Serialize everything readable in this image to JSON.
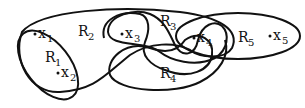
{
  "diagram": {
    "type": "hypergraph",
    "vertices": [
      {
        "id": "x1",
        "name": "x",
        "sub": "1"
      },
      {
        "id": "x2",
        "name": "x",
        "sub": "2"
      },
      {
        "id": "x3",
        "name": "x",
        "sub": "3"
      },
      {
        "id": "x4",
        "name": "x",
        "sub": "4"
      },
      {
        "id": "x5",
        "name": "x",
        "sub": "5"
      }
    ],
    "hyperedges": [
      {
        "id": "R1",
        "name": "R",
        "sub": "1",
        "members": [
          "x1",
          "x2"
        ]
      },
      {
        "id": "R2",
        "name": "R",
        "sub": "2",
        "members": [
          "x1",
          "x2",
          "x3",
          "x4"
        ]
      },
      {
        "id": "R3",
        "name": "R",
        "sub": "3",
        "members": [
          "x3",
          "x4"
        ]
      },
      {
        "id": "R4",
        "name": "R",
        "sub": "4",
        "members": [
          "x3",
          "x4"
        ]
      },
      {
        "id": "R5",
        "name": "R",
        "sub": "5",
        "members": [
          "x4",
          "x5"
        ]
      }
    ]
  }
}
